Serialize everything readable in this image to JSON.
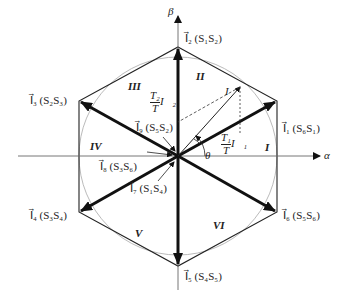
{
  "axes": {
    "alpha": "α",
    "beta": "β"
  },
  "vectors": [
    {
      "name": "I1",
      "label": "I⃗₁ (S₆S₁)"
    },
    {
      "name": "I2",
      "label": "I⃗₂ (S₁S₂)"
    },
    {
      "name": "I3",
      "label": "I⃗₃ (S₂S₃)"
    },
    {
      "name": "I4",
      "label": "I⃗₄ (S₃S₄)"
    },
    {
      "name": "I5",
      "label": "I⃗₅ (S₄S₅)"
    },
    {
      "name": "I6",
      "label": "I⃗₆ (S₅S₆)"
    },
    {
      "name": "I7",
      "label": "I⃗₇ (S₁S₄)"
    },
    {
      "name": "I8",
      "label": "I⃗₈ (S₃S₆)"
    },
    {
      "name": "I9",
      "label": "I⃗₉ (S₅S₂)"
    }
  ],
  "reference": {
    "label": "I⃗",
    "angle": "θ"
  },
  "components": {
    "t1": {
      "num": "T₁",
      "den": "T",
      "vec": "I⃗₁"
    },
    "t2": {
      "num": "T₂",
      "den": "T",
      "vec": "I⃗₂"
    }
  },
  "sectors": [
    "I",
    "II",
    "III",
    "IV",
    "V",
    "VI"
  ]
}
